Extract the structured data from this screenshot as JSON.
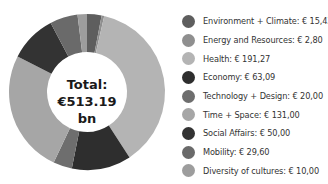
{
  "chart_data": {
    "type": "pie",
    "variant": "donut",
    "title": "",
    "center_label": {
      "line1": "Total:",
      "line2": "€513.19 bn"
    },
    "categories": [
      "Environment + Climate",
      "Energy and Resources",
      "Health",
      "Economy",
      "Technology + Design",
      "Time + Space",
      "Social Affairs",
      "Mobility",
      "Diversity of cultures"
    ],
    "values": [
      15.43,
      2.8,
      191.27,
      63.09,
      20.0,
      131.0,
      50.0,
      29.6,
      10.0
    ],
    "value_labels": [
      "€ 15,43",
      "€ 2,80",
      "€ 191,27",
      "€ 63,09",
      "€ 20,00",
      "€ 131,00",
      "€ 50,00",
      "€ 29,60",
      "€ 10,00"
    ],
    "colors": [
      "#5e5e5e",
      "#8f8f8f",
      "#b4b4b4",
      "#2e2e2e",
      "#6e6e6e",
      "#a6a6a6",
      "#333333",
      "#6a6a6a",
      "#9d9d9d"
    ],
    "unit": "bn",
    "start_angle_deg": 0,
    "direction": "clockwise",
    "legend_position": "right"
  },
  "legend": {
    "items": [
      {
        "label": "Environment + Climate: € 15,43",
        "color": "#5e5e5e"
      },
      {
        "label": "Energy and Resources: € 2,80",
        "color": "#8f8f8f"
      },
      {
        "label": "Health: € 191,27",
        "color": "#b4b4b4"
      },
      {
        "label": "Economy: € 63,09",
        "color": "#2e2e2e"
      },
      {
        "label": "Technology + Design: € 20,00",
        "color": "#6e6e6e"
      },
      {
        "label": "Time + Space: € 131,00",
        "color": "#a6a6a6"
      },
      {
        "label": "Social Affairs: € 50,00",
        "color": "#333333"
      },
      {
        "label": "Mobility: € 29,60",
        "color": "#6a6a6a"
      },
      {
        "label": "Diversity of cultures: € 10,00",
        "color": "#9d9d9d"
      }
    ]
  }
}
